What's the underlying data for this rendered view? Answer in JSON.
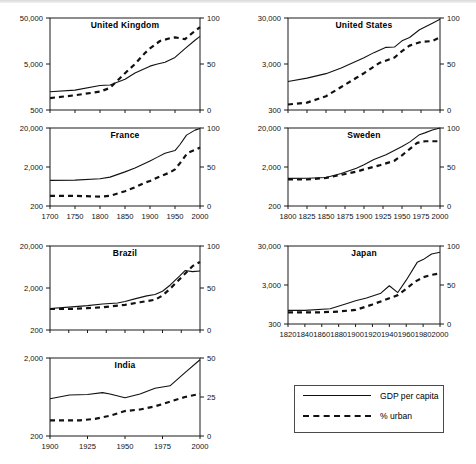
{
  "figure": {
    "background": "#ffffff",
    "ink": "#111111",
    "scanline": true
  },
  "legend": {
    "position": "bottom-right",
    "entries": [
      {
        "label": "GDP per capita",
        "style": "solid"
      },
      {
        "label": "% urban",
        "style": "dashed"
      }
    ]
  },
  "chart_data": [
    {
      "type": "line",
      "title": "United Kingdom",
      "xlabel": "",
      "ylabel": "",
      "grid": false,
      "x_axis": {
        "min": 1700,
        "max": 2000,
        "ticks": [
          1700,
          1750,
          1800,
          1850,
          1900,
          1950,
          2000
        ],
        "tick_labels_visible": false
      },
      "y_axis_left": {
        "scale": "log",
        "min": 500,
        "max": 50000,
        "ticks": [
          500,
          5000,
          50000
        ],
        "tick_labels": [
          "500",
          "5,000",
          "50,000"
        ]
      },
      "y_axis_right": {
        "scale": "linear",
        "min": 0,
        "max": 100,
        "ticks": [
          0,
          50,
          100
        ],
        "tick_labels": [
          "0",
          "50",
          "100"
        ]
      },
      "series": [
        {
          "name": "GDP per capita",
          "style": "solid",
          "axis": "left",
          "x": [
            1700,
            1750,
            1800,
            1820,
            1850,
            1870,
            1900,
            1913,
            1930,
            1950,
            1970,
            1990,
            2000
          ],
          "values": [
            1250,
            1350,
            1700,
            1750,
            2330,
            3190,
            4490,
            4920,
            5440,
            6940,
            10770,
            16430,
            20000
          ]
        },
        {
          "name": "% urban",
          "style": "dashed",
          "axis": "right",
          "x": [
            1700,
            1750,
            1800,
            1820,
            1850,
            1870,
            1890,
            1900,
            1920,
            1940,
            1950,
            1970,
            1990,
            2000
          ],
          "values": [
            13,
            16,
            20,
            24,
            40,
            50,
            62,
            67,
            75,
            78,
            79,
            77,
            86,
            90
          ]
        }
      ]
    },
    {
      "type": "line",
      "title": "United States",
      "xlabel": "",
      "ylabel": "",
      "grid": false,
      "x_axis": {
        "min": 1800,
        "max": 2000,
        "ticks": [
          1800,
          1825,
          1850,
          1875,
          1900,
          1925,
          1950,
          1975,
          2000
        ],
        "tick_labels_visible": false
      },
      "y_axis_left": {
        "scale": "log",
        "min": 300,
        "max": 30000,
        "ticks": [
          300,
          3000,
          30000
        ],
        "tick_labels": [
          "300",
          "3,000",
          "30,000"
        ]
      },
      "y_axis_right": {
        "scale": "linear",
        "min": 0,
        "max": 100,
        "ticks": [
          0,
          50,
          100
        ],
        "tick_labels": [
          "0",
          "50",
          "100"
        ]
      },
      "series": [
        {
          "name": "GDP per capita",
          "style": "solid",
          "axis": "left",
          "x": [
            1800,
            1825,
            1850,
            1870,
            1900,
            1913,
            1929,
            1940,
            1950,
            1960,
            1973,
            1990,
            2000
          ],
          "values": [
            1250,
            1480,
            1850,
            2450,
            4100,
            5300,
            6900,
            7000,
            9560,
            11330,
            16690,
            23200,
            28100
          ]
        },
        {
          "name": "% urban",
          "style": "dashed",
          "axis": "right",
          "x": [
            1800,
            1825,
            1850,
            1870,
            1890,
            1900,
            1920,
            1940,
            1950,
            1960,
            1975,
            1990,
            2000
          ],
          "values": [
            6,
            8,
            15,
            25,
            35,
            40,
            51,
            57,
            64,
            70,
            74,
            75,
            79
          ]
        }
      ]
    },
    {
      "type": "line",
      "title": "France",
      "xlabel": "",
      "ylabel": "",
      "grid": false,
      "x_axis": {
        "min": 1700,
        "max": 2000,
        "ticks": [
          1700,
          1750,
          1800,
          1850,
          1900,
          1950,
          2000
        ],
        "tick_labels": [
          "1700",
          "1750",
          "1800",
          "1850",
          "1900",
          "1950",
          "2000"
        ],
        "tick_labels_visible": true
      },
      "y_axis_left": {
        "scale": "log",
        "min": 200,
        "max": 20000,
        "ticks": [
          200,
          2000,
          20000
        ],
        "tick_labels": [
          "200",
          "2,000",
          "20,000"
        ]
      },
      "y_axis_right": {
        "scale": "linear",
        "min": 0,
        "max": 100,
        "ticks": [
          0,
          50,
          100
        ],
        "tick_labels": [
          "0",
          "50",
          "100"
        ]
      },
      "series": [
        {
          "name": "GDP per capita",
          "style": "solid",
          "axis": "left",
          "x": [
            1700,
            1750,
            1800,
            1820,
            1850,
            1870,
            1900,
            1913,
            1930,
            1950,
            1960,
            1973,
            1990,
            2000
          ],
          "values": [
            910,
            920,
            1000,
            1100,
            1500,
            1880,
            2870,
            3480,
            4500,
            5270,
            7550,
            13120,
            17650,
            19500
          ]
        },
        {
          "name": "% urban",
          "style": "dashed",
          "axis": "right",
          "x": [
            1700,
            1750,
            1800,
            1820,
            1850,
            1870,
            1890,
            1900,
            1920,
            1940,
            1950,
            1960,
            1975,
            1990,
            2000
          ],
          "values": [
            13,
            13,
            12,
            13,
            19,
            24,
            30,
            32,
            38,
            43,
            47,
            55,
            68,
            72,
            75
          ]
        }
      ]
    },
    {
      "type": "line",
      "title": "Sweden",
      "xlabel": "",
      "ylabel": "",
      "grid": false,
      "x_axis": {
        "min": 1800,
        "max": 2000,
        "ticks": [
          1800,
          1825,
          1850,
          1875,
          1900,
          1925,
          1950,
          1975,
          2000
        ],
        "tick_labels": [
          "1800",
          "1825",
          "1850",
          "1875",
          "1900",
          "1925",
          "1950",
          "1975",
          "2000"
        ],
        "tick_labels_visible": true
      },
      "y_axis_left": {
        "scale": "log",
        "min": 200,
        "max": 20000,
        "ticks": [
          200,
          2000,
          20000
        ],
        "tick_labels": [
          "200",
          "2,000",
          "20,000"
        ]
      },
      "y_axis_right": {
        "scale": "linear",
        "min": 0,
        "max": 100,
        "ticks": [
          0,
          50,
          100
        ],
        "tick_labels": [
          "0",
          "50",
          "100"
        ]
      },
      "series": [
        {
          "name": "GDP per capita",
          "style": "solid",
          "axis": "left",
          "x": [
            1800,
            1825,
            1850,
            1870,
            1890,
            1900,
            1913,
            1929,
            1950,
            1960,
            1973,
            1980,
            1990,
            2000
          ],
          "values": [
            1020,
            1030,
            1080,
            1360,
            1850,
            2280,
            3100,
            4100,
            6740,
            8690,
            13500,
            15000,
            17700,
            20000
          ]
        },
        {
          "name": "% urban",
          "style": "dashed",
          "axis": "right",
          "x": [
            1800,
            1825,
            1850,
            1870,
            1890,
            1900,
            1920,
            1940,
            1950,
            1960,
            1970,
            1980,
            1990,
            2000
          ],
          "values": [
            34,
            34,
            36,
            40,
            44,
            47,
            52,
            58,
            65,
            73,
            81,
            83,
            83,
            83
          ]
        }
      ]
    },
    {
      "type": "line",
      "title": "Brazil",
      "xlabel": "",
      "ylabel": "",
      "grid": false,
      "x_axis": {
        "min": 1800,
        "max": 2000,
        "ticks": [
          1800,
          1825,
          1850,
          1875,
          1900,
          1925,
          1950,
          1975,
          2000
        ],
        "tick_labels_visible": false
      },
      "y_axis_left": {
        "scale": "log",
        "min": 200,
        "max": 20000,
        "ticks": [
          200,
          2000,
          20000
        ],
        "tick_labels": [
          "200",
          "2,000",
          "20,000"
        ]
      },
      "y_axis_right": {
        "scale": "linear",
        "min": 0,
        "max": 100,
        "ticks": [
          0,
          50,
          100
        ],
        "tick_labels": [
          "0",
          "50",
          "100"
        ]
      },
      "series": [
        {
          "name": "GDP per capita",
          "style": "solid",
          "axis": "left",
          "x": [
            1800,
            1825,
            1850,
            1870,
            1890,
            1900,
            1913,
            1929,
            1940,
            1950,
            1960,
            1973,
            1980,
            1990,
            2000
          ],
          "values": [
            650,
            700,
            760,
            830,
            880,
            950,
            1100,
            1300,
            1400,
            1670,
            2330,
            3880,
            5200,
            4920,
            5100
          ]
        },
        {
          "name": "% urban",
          "style": "dashed",
          "axis": "right",
          "x": [
            1800,
            1825,
            1850,
            1870,
            1890,
            1900,
            1920,
            1940,
            1950,
            1960,
            1970,
            1980,
            1990,
            2000
          ],
          "values": [
            25,
            25,
            26,
            27,
            29,
            30,
            33,
            36,
            41,
            49,
            58,
            67,
            76,
            81
          ]
        }
      ]
    },
    {
      "type": "line",
      "title": "Japan",
      "xlabel": "",
      "ylabel": "",
      "grid": false,
      "x_axis": {
        "min": 1820,
        "max": 2000,
        "ticks": [
          1820,
          1840,
          1860,
          1880,
          1900,
          1920,
          1940,
          1960,
          1980,
          2000
        ],
        "tick_labels": [
          "1820",
          "1840",
          "1860",
          "1880",
          "1900",
          "1920",
          "1940",
          "1960",
          "1980",
          "2000"
        ],
        "tick_labels_visible": true
      },
      "y_axis_left": {
        "scale": "log",
        "min": 300,
        "max": 30000,
        "ticks": [
          300,
          3000,
          30000
        ],
        "tick_labels": [
          "300",
          "3,000",
          "30,000"
        ]
      },
      "y_axis_right": {
        "scale": "linear",
        "min": 0,
        "max": 100,
        "ticks": [
          0,
          50,
          100
        ],
        "tick_labels": [
          "0",
          "50",
          "100"
        ]
      },
      "series": [
        {
          "name": "GDP per capita",
          "style": "solid",
          "axis": "left",
          "x": [
            1820,
            1840,
            1870,
            1890,
            1900,
            1913,
            1930,
            1940,
            1950,
            1960,
            1973,
            1980,
            1990,
            2000
          ],
          "values": [
            670,
            670,
            740,
            1010,
            1180,
            1390,
            1850,
            2870,
            1920,
            3990,
            11430,
            13430,
            18790,
            20700
          ]
        },
        {
          "name": "% urban",
          "style": "dashed",
          "axis": "right",
          "x": [
            1820,
            1840,
            1860,
            1880,
            1900,
            1920,
            1940,
            1950,
            1960,
            1970,
            1980,
            1990,
            2000
          ],
          "values": [
            15,
            15,
            15,
            16,
            18,
            25,
            33,
            37,
            45,
            54,
            60,
            63,
            65
          ]
        }
      ]
    },
    {
      "type": "line",
      "title": "India",
      "xlabel": "",
      "ylabel": "",
      "grid": false,
      "x_axis": {
        "min": 1900,
        "max": 2000,
        "ticks": [
          1900,
          1925,
          1950,
          1975,
          2000
        ],
        "tick_labels": [
          "1900",
          "1925",
          "1950",
          "1975",
          "2000"
        ],
        "tick_labels_visible": true
      },
      "y_axis_left": {
        "scale": "log",
        "min": 200,
        "max": 2000,
        "ticks": [
          200,
          2000
        ],
        "tick_labels": [
          "200",
          "2,000"
        ]
      },
      "y_axis_right": {
        "scale": "linear",
        "min": 0,
        "max": 50,
        "ticks": [
          0,
          25,
          50
        ],
        "tick_labels": [
          "0",
          "25",
          "50"
        ]
      },
      "series": [
        {
          "name": "GDP per capita",
          "style": "solid",
          "axis": "left",
          "x": [
            1900,
            1913,
            1925,
            1935,
            1940,
            1950,
            1960,
            1970,
            1980,
            1990,
            2000
          ],
          "values": [
            600,
            670,
            680,
            720,
            690,
            620,
            690,
            820,
            880,
            1300,
            1900
          ]
        },
        {
          "name": "% urban",
          "style": "dashed",
          "axis": "right",
          "x": [
            1900,
            1910,
            1920,
            1930,
            1940,
            1950,
            1960,
            1970,
            1980,
            1990,
            2000
          ],
          "values": [
            10,
            10,
            10,
            11,
            13,
            16,
            17,
            19,
            22,
            25,
            27
          ]
        }
      ]
    }
  ]
}
